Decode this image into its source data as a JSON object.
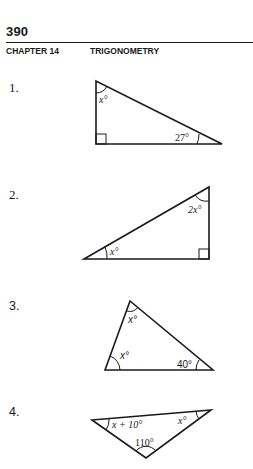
{
  "header": {
    "page_number": "390",
    "chapter_label": "CHAPTER 14",
    "chapter_title": "TRIGONOMETRY"
  },
  "problems": [
    {
      "number": "1.",
      "shape": "right-triangle",
      "labels": {
        "top_angle": "x°",
        "right_angle": "27°"
      },
      "right_angle_marker": "bottom-left"
    },
    {
      "number": "2.",
      "shape": "right-triangle",
      "labels": {
        "top_angle": "2x°",
        "left_angle": "x°"
      },
      "right_angle_marker": "bottom-right"
    },
    {
      "number": "3.",
      "shape": "triangle",
      "labels": {
        "top_angle": "x°",
        "left_angle": "x°",
        "right_angle": "40°"
      }
    },
    {
      "number": "4.",
      "shape": "obtuse-triangle",
      "labels": {
        "left_angle": "x + 10°",
        "right_angle": "x°",
        "bottom_angle": "110°"
      }
    }
  ],
  "colors": {
    "ink": "#1a1a1a",
    "paper": "#ffffff"
  }
}
